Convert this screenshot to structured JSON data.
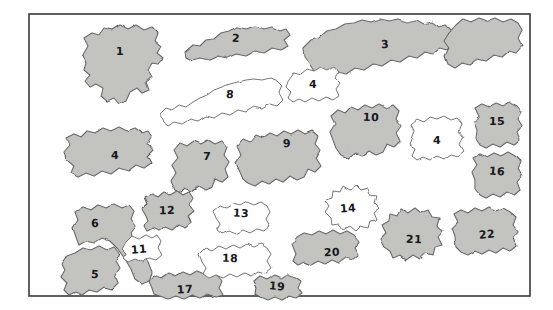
{
  "figure": {
    "width": 553,
    "height": 310,
    "background_color": "#ffffff",
    "frame": {
      "name": "border-frame",
      "x": 29,
      "y": 14,
      "width": 501,
      "height": 282,
      "stroke_color": "#3a3a3e",
      "stroke_width": 1.6,
      "fill_color": "#ffffff"
    },
    "palette": {
      "filled_fill": "#c9c9c5",
      "filled_fill_light": "#d3d3cf",
      "filled_fill_dark": "#b8b8b4",
      "unfilled_fill": "#ffffff",
      "outline_color": "#5a5a5e",
      "outline_color_soft": "#6f6f73",
      "label_color": "#17171c"
    }
  },
  "shapes": [
    {
      "id": "blob-1",
      "label": "1",
      "filled": true,
      "tone": "#c9c9c5",
      "label_x": 120,
      "label_y": 52,
      "points": "86,63 83,55 88,46 84,38 92,33 99,35 104,28 112,30 120,25 128,29 136,25 144,30 152,27 158,33 155,41 161,46 157,53 163,58 158,64 152,63 148,70 152,77 146,82 149,90 142,93 137,88 130,92 126,101 119,104 114,98 107,101 101,96 103,88 96,84 90,87 85,81 90,75 84,70"
    },
    {
      "id": "blob-2",
      "label": "2",
      "filled": true,
      "tone": "#c9c9c5",
      "label_x": 236,
      "label_y": 39,
      "points": "185,52 193,45 200,46 206,40 214,39 221,33 229,31 237,27 246,29 255,26 264,29 272,27 280,31 286,29 290,35 284,40 288,46 281,50 272,48 264,53 255,51 246,56 236,54 227,58 218,56 209,60 200,58 192,60 186,57"
    },
    {
      "id": "blob-3",
      "label": "3",
      "filled": true,
      "tone": "#c9c9c5",
      "label_x": 385,
      "label_y": 45,
      "points": "303,48 311,40 319,38 327,31 336,29 345,24 354,23 362,20 371,22 380,19 389,21 398,19 407,22 416,20 424,24 432,22 439,27 446,25 452,31 448,38 453,44 447,50 440,48 433,54 425,52 417,58 409,56 400,62 391,60 382,66 373,64 364,70 355,68 346,74 337,72 329,78 321,76 314,71 309,63 304,57"
    },
    {
      "id": "blob-3b",
      "label": "",
      "filled": true,
      "tone": "#c9c9c5",
      "label_x": 0,
      "label_y": 0,
      "points": "456,25 463,19 471,22 479,18 487,21 495,18 503,22 511,19 518,23 522,30 518,38 522,46 516,53 509,51 502,57 494,55 486,61 478,59 470,65 462,63 455,68 448,64 445,56 449,48 444,41 449,33"
    },
    {
      "id": "blob-4a",
      "label": "4",
      "filled": false,
      "tone": "#ffffff",
      "label_x": 313,
      "label_y": 85,
      "points": "289,79 294,72 301,74 307,69 314,71 321,67 328,70 334,67 338,72 335,78 340,83 336,89 339,96 333,100 326,97 319,101 312,98 305,102 299,99 293,102 288,98 291,92 286,87"
    },
    {
      "id": "blob-4b",
      "label": "4",
      "filled": false,
      "tone": "#ffffff",
      "label_x": 437,
      "label_y": 141,
      "points": "411,139 414,131 411,124 417,119 424,122 430,117 437,119 444,116 451,120 457,118 462,124 459,131 464,137 460,144 464,151 458,156 451,154 444,159 437,156 430,160 423,157 417,160 412,156 415,149 409,145"
    },
    {
      "id": "blob-4c",
      "label": "4",
      "filled": true,
      "tone": "#c9c9c5",
      "label_x": 115,
      "label_y": 156,
      "points": "67,160 64,152 70,145 66,138 74,134 81,137 87,131 95,133 103,128 111,131 119,127 127,131 135,128 142,133 148,131 152,137 148,144 153,150 147,156 151,163 144,168 136,165 128,171 119,168 111,174 102,171 94,176 86,173 78,177 71,173 74,166"
    },
    {
      "id": "blob-5",
      "label": "5",
      "filled": true,
      "tone": "#c9c9c5",
      "label_x": 95,
      "label_y": 275,
      "points": "62,264 67,256 75,253 83,248 91,250 99,246 107,250 114,247 119,253 116,261 120,268 115,275 118,283 112,289 104,287 97,292 89,290 82,295 75,292 69,295 64,290 67,283 61,277 65,270"
    },
    {
      "id": "blob-6",
      "label": "6",
      "filled": true,
      "tone": "#c9c9c5",
      "label_x": 95,
      "label_y": 224,
      "points": "76,237 73,228 78,220 75,212 83,207 91,210 98,205 106,208 114,204 122,208 129,205 134,211 131,219 136,226 131,233 134,242 141,252 148,262 152,272 149,281 142,284 135,279 131,269 125,259 118,249 110,241 102,238 94,243 86,241 79,245"
    },
    {
      "id": "blob-7",
      "label": "7",
      "filled": true,
      "tone": "#c9c9c5",
      "label_x": 207,
      "label_y": 157,
      "points": "175,190 171,181 176,173 172,165 178,158 174,150 180,143 187,146 194,141 201,144 208,140 215,144 222,141 227,147 224,155 229,162 225,169 228,177 222,182 215,179 212,187 205,190 198,186 191,191 184,188 179,193"
    },
    {
      "id": "blob-8",
      "label": "8",
      "filled": false,
      "tone": "#ffffff",
      "label_x": 230,
      "label_y": 95,
      "points": "163,122 160,114 166,108 172,110 179,105 186,107 193,102 200,98 207,95 214,90 222,87 230,84 238,82 246,80 254,79 262,80 270,78 277,81 282,86 279,93 283,100 277,106 270,104 262,109 254,107 246,112 238,110 230,115 222,113 214,118 206,116 198,121 190,119 182,124 174,122 168,126"
    },
    {
      "id": "blob-9",
      "label": "9",
      "filled": true,
      "tone": "#c9c9c5",
      "label_x": 287,
      "label_y": 144,
      "points": "240,172 236,163 241,155 237,146 243,139 250,142 256,135 263,138 270,133 277,136 284,131 291,134 298,130 305,134 312,131 318,136 315,144 320,150 316,158 321,166 315,172 308,169 304,177 297,180 290,176 283,182 276,179 269,184 262,181 255,186 248,183 243,179"
    },
    {
      "id": "blob-10",
      "label": "10",
      "filled": true,
      "tone": "#c9c9c5",
      "label_x": 371,
      "label_y": 118,
      "points": "333,140 330,132 335,124 331,116 338,110 345,113 351,107 358,110 365,105 372,108 379,104 386,108 393,105 399,111 396,119 401,126 396,133 400,141 394,147 387,144 383,152 376,155 369,151 362,156 355,153 348,158 341,155 336,148"
    },
    {
      "id": "blob-11",
      "label": "11",
      "filled": false,
      "tone": "#ffffff",
      "label_x": 139,
      "label_y": 250,
      "points": "122,249 126,242 132,236 139,239 146,235 152,238 157,235 161,241 158,248 162,255 156,260 149,258 142,262 135,259 128,262 123,258 126,253"
    },
    {
      "id": "blob-12",
      "label": "12",
      "filled": true,
      "tone": "#c9c9c5",
      "label_x": 167,
      "label_y": 211,
      "points": "146,216 142,209 148,204 145,197 152,194 158,197 164,192 170,195 177,191 183,195 189,192 193,198 189,205 194,211 188,216 191,223 185,228 178,225 172,230 165,227 159,231 153,228 147,231 144,226 148,221"
    },
    {
      "id": "blob-13",
      "label": "13",
      "filled": false,
      "tone": "#ffffff",
      "label_x": 241,
      "label_y": 214,
      "points": "216,218 213,211 219,206 226,208 233,204 240,206 247,202 254,205 261,202 267,206 270,212 266,219 270,226 264,231 257,229 250,233 243,230 236,234 229,231 222,234 217,230 220,224"
    },
    {
      "id": "blob-14",
      "label": "14",
      "filled": false,
      "tone": "#ffffff",
      "label_x": 348,
      "label_y": 209,
      "points": "325,212 329,206 325,200 332,198 333,191 340,192 343,186 350,190 356,185 361,190 368,188 370,195 377,196 375,203 380,208 374,213 377,220 370,221 368,228 361,226 356,231 350,226 343,230 339,224 332,225 331,218"
    },
    {
      "id": "blob-15",
      "label": "15",
      "filled": true,
      "tone": "#c9c9c5",
      "label_x": 497,
      "label_y": 122,
      "points": "477,131 474,123 479,116 475,108 482,104 489,107 496,103 503,106 510,102 517,106 522,112 518,119 522,126 517,132 520,140 514,145 507,142 500,147 493,144 486,148 480,145 476,139"
    },
    {
      "id": "blob-16",
      "label": "16",
      "filled": true,
      "tone": "#c9c9c5",
      "label_x": 497,
      "label_y": 172,
      "points": "475,180 472,172 477,165 473,158 480,154 487,157 494,153 501,156 508,152 515,156 521,161 518,169 522,176 517,182 520,190 514,195 507,192 500,197 493,194 486,198 480,195 475,189"
    },
    {
      "id": "blob-17",
      "label": "17",
      "filled": true,
      "tone": "#c9c9c5",
      "label_x": 185,
      "label_y": 290,
      "points": "152,288 149,281 155,275 162,278 169,273 176,276 183,272 190,275 197,271 204,274 211,271 217,275 222,281 219,288 223,295 216,297 208,294 200,298 192,295 184,299 176,296 168,299 160,296 154,294"
    },
    {
      "id": "blob-18",
      "label": "18",
      "filled": false,
      "tone": "#ffffff",
      "label_x": 230,
      "label_y": 259,
      "points": "202,262 199,254 205,248 212,251 219,246 226,249 233,245 240,248 247,244 254,247 261,244 267,248 271,254 267,261 271,268 265,273 258,271 251,276 244,273 237,277 230,274 223,278 216,275 209,278 203,274 206,268"
    },
    {
      "id": "blob-19",
      "label": "19",
      "filled": true,
      "tone": "#c9c9c5",
      "label_x": 277,
      "label_y": 287,
      "points": "257,288 254,281 260,276 267,279 274,275 281,278 288,274 295,277 301,281 298,288 302,294 296,298 289,296 282,300 275,297 268,300 261,297 256,294"
    },
    {
      "id": "blob-20",
      "label": "20",
      "filled": true,
      "tone": "#c9c9c5",
      "label_x": 332,
      "label_y": 253,
      "points": "292,244 297,237 304,233 312,235 319,231 326,234 333,230 340,234 347,231 354,235 359,241 355,248 359,255 353,260 346,258 339,263 332,260 325,264 318,261 311,265 304,262 298,265 293,261 296,254"
    },
    {
      "id": "blob-21",
      "label": "21",
      "filled": true,
      "tone": "#c9c9c5",
      "label_x": 414,
      "label_y": 240,
      "points": "384,247 380,239 386,233 382,225 389,221 390,214 397,216 401,209 408,213 415,208 421,213 428,210 432,217 439,218 437,226 443,231 438,237 442,245 435,247 433,255 426,253 420,259 413,255 406,260 400,255 393,258 390,251"
    },
    {
      "id": "blob-22",
      "label": "22",
      "filled": true,
      "tone": "#c9c9c5",
      "label_x": 487,
      "label_y": 235,
      "points": "455,236 452,228 458,222 454,214 461,210 468,213 475,208 482,211 489,207 496,211 503,208 510,212 516,217 513,225 518,232 513,238 516,246 510,251 503,248 496,253 489,250 482,254 475,251 468,255 461,252 456,247"
    }
  ],
  "summary": {
    "total_shapes": 26,
    "numbered_shapes": 25,
    "unnumbered_shapes": 1,
    "distinct_labels": [
      "1",
      "2",
      "3",
      "4",
      "5",
      "6",
      "7",
      "8",
      "9",
      "10",
      "11",
      "12",
      "13",
      "14",
      "15",
      "16",
      "17",
      "18",
      "19",
      "20",
      "21",
      "22"
    ],
    "filled_count": 19,
    "unfilled_count": 7
  }
}
